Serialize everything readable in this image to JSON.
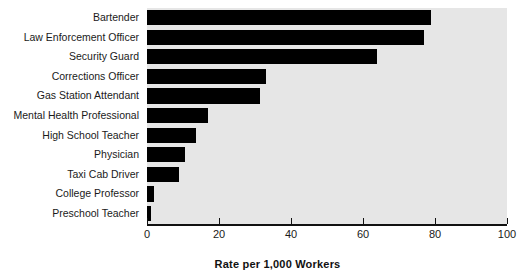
{
  "chart_data": {
    "type": "bar",
    "orientation": "horizontal",
    "title": "",
    "subtitle": "",
    "xlabel": "Rate per 1,000 Workers",
    "ylabel": "",
    "xlim": [
      0,
      100
    ],
    "xticks": [
      0,
      20,
      40,
      60,
      80,
      100
    ],
    "xtick_labels": [
      "0",
      "20",
      "40",
      "60",
      "80",
      "100"
    ],
    "grid": false,
    "legend": false,
    "legend_position": "none",
    "categories": [
      "Bartender",
      "Law Enforcement Officer",
      "Security Guard",
      "Corrections Officer",
      "Gas Station Attendant",
      "Mental Health Professional",
      "High School Teacher",
      "Physician",
      "Taxi Cab Driver",
      "College Professor",
      "Preschool Teacher"
    ],
    "values": [
      79,
      77,
      64,
      33,
      31.5,
      17,
      13.5,
      10.5,
      9,
      2,
      1
    ],
    "bar_color": "#000000",
    "plot_background": "#e6e6e6",
    "figure_background": "#ffffff"
  }
}
